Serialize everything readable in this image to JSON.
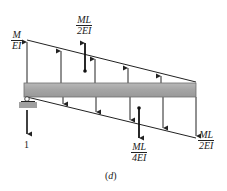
{
  "figure": {
    "caption_prefix": "(",
    "caption_letter": "d",
    "caption_suffix": ")",
    "top_cropped_label": "(c)"
  },
  "labels": {
    "left_ordinate": {
      "num": "M",
      "den": "EI"
    },
    "top_resultant": {
      "num": "ML",
      "den": "2EI"
    },
    "bottom_resultant": {
      "num": "ML",
      "den": "4EI"
    },
    "right_ordinate": {
      "num": "ML",
      "den": "2EI"
    },
    "unit_load": "1"
  },
  "colors": {
    "beam_fill": "#a8a8a8",
    "beam_edge": "#6e6e6e",
    "line": "#222222",
    "background": "#ffffff"
  },
  "geometry": {
    "beam": {
      "x1": 24,
      "x2": 196,
      "y_top": 83,
      "y_bottom": 97
    },
    "upper_diagram": {
      "left": [
        27,
        40
      ],
      "right": [
        196,
        82
      ]
    },
    "lower_diagram": {
      "left": [
        27,
        97
      ],
      "right": [
        196,
        138
      ]
    }
  }
}
